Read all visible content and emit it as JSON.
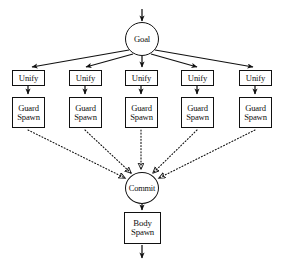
{
  "figure": {
    "type": "flow-diagram",
    "width": 282,
    "height": 263,
    "background_color": "#ffffff",
    "stroke_color": "#111111",
    "caption_fragment": ""
  },
  "nodes": {
    "goal": {
      "id": "goal",
      "label": "Goal",
      "shape": "circle",
      "cx": 142,
      "cy": 39,
      "r": 17
    },
    "commit": {
      "id": "commit",
      "label": "Commit",
      "shape": "circle",
      "cx": 142,
      "cy": 188,
      "r": 16
    },
    "body_spawn": {
      "id": "body-spawn",
      "label_line1": "Body",
      "label_line2": "Spawn",
      "shape": "rect",
      "x": 124,
      "y": 212
    },
    "unify": [
      {
        "id": "unify-1",
        "label": "Unify",
        "x": 12,
        "y": 70
      },
      {
        "id": "unify-2",
        "label": "Unify",
        "x": 69,
        "y": 70
      },
      {
        "id": "unify-3",
        "label": "Unify",
        "x": 125,
        "y": 70
      },
      {
        "id": "unify-4",
        "label": "Unify",
        "x": 181,
        "y": 70
      },
      {
        "id": "unify-5",
        "label": "Unify",
        "x": 239,
        "y": 70
      }
    ],
    "guard_spawn": [
      {
        "id": "guard-spawn-1",
        "label_line1": "Guard",
        "label_line2": "Spawn",
        "x": 12,
        "y": 97
      },
      {
        "id": "guard-spawn-2",
        "label_line1": "Guard",
        "label_line2": "Spawn",
        "x": 69,
        "y": 97
      },
      {
        "id": "guard-spawn-3",
        "label_line1": "Guard",
        "label_line2": "Spawn",
        "x": 125,
        "y": 97
      },
      {
        "id": "guard-spawn-4",
        "label_line1": "Guard",
        "label_line2": "Spawn",
        "x": 181,
        "y": 97
      },
      {
        "id": "guard-spawn-5",
        "label_line1": "Guard",
        "label_line2": "Spawn",
        "x": 239,
        "y": 97
      }
    ]
  },
  "edges": {
    "solid_style": "solid",
    "dotted_style": "dotted",
    "entry_arrow": {
      "from": "top-of-figure",
      "to": "goal"
    },
    "goal_to_unify": [
      {
        "from": "goal",
        "to": "unify-1"
      },
      {
        "from": "goal",
        "to": "unify-2"
      },
      {
        "from": "goal",
        "to": "unify-3"
      },
      {
        "from": "goal",
        "to": "unify-4"
      },
      {
        "from": "goal",
        "to": "unify-5"
      }
    ],
    "unify_to_guard": [
      {
        "from": "unify-1",
        "to": "guard-spawn-1"
      },
      {
        "from": "unify-2",
        "to": "guard-spawn-2"
      },
      {
        "from": "unify-3",
        "to": "guard-spawn-3"
      },
      {
        "from": "unify-4",
        "to": "guard-spawn-4"
      },
      {
        "from": "unify-5",
        "to": "guard-spawn-5"
      }
    ],
    "guard_to_commit": [
      {
        "from": "guard-spawn-1",
        "to": "commit"
      },
      {
        "from": "guard-spawn-2",
        "to": "commit"
      },
      {
        "from": "guard-spawn-3",
        "to": "commit"
      },
      {
        "from": "guard-spawn-4",
        "to": "commit"
      },
      {
        "from": "guard-spawn-5",
        "to": "commit"
      }
    ],
    "commit_to_body": {
      "from": "commit",
      "to": "body-spawn"
    },
    "exit_arrow": {
      "from": "body-spawn",
      "to": "bottom-of-figure"
    }
  }
}
